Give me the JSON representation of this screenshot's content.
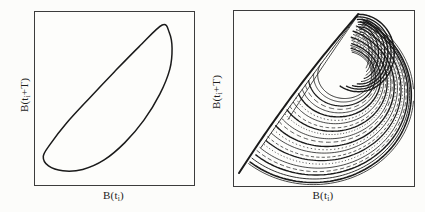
{
  "figure": {
    "background": "#fcfcfa",
    "ink": "#1a1a1a",
    "border_color": "#3c3c3c",
    "panels": [
      {
        "name": "limit-cycle-panel",
        "box": {
          "left": 34,
          "top": 11,
          "width": 159,
          "height": 173
        },
        "ylabel": {
          "prefix": "B(t",
          "sub": "i",
          "suffix": "+T)"
        },
        "xlabel": {
          "prefix": "B(t",
          "sub": "i",
          "suffix": ")"
        }
      },
      {
        "name": "chaotic-attractor-panel",
        "box": {
          "left": 233,
          "top": 10,
          "width": 180,
          "height": 175
        },
        "ylabel": {
          "prefix": "B(t",
          "sub": "i",
          "suffix": "+T)"
        },
        "xlabel": {
          "prefix": "B(t",
          "sub": "i",
          "suffix": ")"
        }
      }
    ]
  },
  "chart_data": [
    {
      "type": "line",
      "title": "Return map: periodic limit cycle",
      "xlabel": "B(t_i)",
      "ylabel": "B(t_i+T)",
      "axes": {
        "ticks": "none",
        "xrange": [
          0,
          1
        ],
        "yrange": [
          0,
          1
        ],
        "grid": false
      },
      "line_width_px": 1.5,
      "loop_points_normalized": [
        [
          0.8,
          0.925
        ],
        [
          0.655,
          0.8
        ],
        [
          0.5,
          0.655
        ],
        [
          0.345,
          0.505
        ],
        [
          0.2,
          0.36
        ],
        [
          0.095,
          0.235
        ],
        [
          0.052,
          0.165
        ],
        [
          0.085,
          0.11
        ],
        [
          0.175,
          0.082
        ],
        [
          0.3,
          0.09
        ],
        [
          0.435,
          0.145
        ],
        [
          0.565,
          0.245
        ],
        [
          0.685,
          0.375
        ],
        [
          0.785,
          0.525
        ],
        [
          0.848,
          0.67
        ],
        [
          0.862,
          0.79
        ],
        [
          0.845,
          0.88
        ]
      ]
    },
    {
      "type": "scatter",
      "title": "Return map: chaotic (strange) attractor",
      "xlabel": "B(t_i)",
      "ylabel": "B(t_i+T)",
      "axes": {
        "ticks": "none",
        "xrange": [
          0,
          1
        ],
        "yrange": [
          0,
          1
        ],
        "grid": false
      },
      "clip_edge": {
        "a": [
          0.024,
          0.066
        ],
        "b": [
          0.694,
          0.99
        ]
      },
      "edge_curves": [
        {
          "p0": [
            0.028,
            0.074
          ],
          "ctrl": [
            0.33,
            0.56
          ],
          "p1": [
            0.69,
            0.982
          ],
          "w": 2.0
        },
        {
          "p0": [
            0.15,
            0.22
          ],
          "ctrl": [
            0.42,
            0.62
          ],
          "p1": [
            0.688,
            0.975
          ],
          "w": 0.9
        },
        {
          "p0": [
            0.3,
            0.38
          ],
          "ctrl": [
            0.5,
            0.7
          ],
          "p1": [
            0.684,
            0.968
          ],
          "w": 0.8
        }
      ],
      "arcs": [
        {
          "c": [
            0.615,
            0.635
          ],
          "r": [
            0.15,
            0.135
          ],
          "a0": 150,
          "sw": 285,
          "w": 0.9
        },
        {
          "c": [
            0.608,
            0.63
          ],
          "r": [
            0.166,
            0.15
          ],
          "a0": 152,
          "sw": 283,
          "w": 0.8
        },
        {
          "c": [
            0.599,
            0.625
          ],
          "r": [
            0.186,
            0.168
          ],
          "a0": 154,
          "sw": 280,
          "w": 1.25
        },
        {
          "c": [
            0.592,
            0.62
          ],
          "r": [
            0.201,
            0.182
          ],
          "a0": 155,
          "sw": 278,
          "w": 0.7,
          "dash": "5.4 3.2"
        },
        {
          "c": [
            0.585,
            0.615
          ],
          "r": [
            0.217,
            0.197
          ],
          "a0": 157,
          "sw": 276,
          "w": 0.8
        },
        {
          "c": [
            0.577,
            0.61
          ],
          "r": [
            0.237,
            0.215
          ],
          "a0": 159,
          "sw": 273,
          "w": 1.45
        },
        {
          "c": [
            0.57,
            0.605
          ],
          "r": [
            0.253,
            0.23
          ],
          "a0": 160,
          "sw": 271,
          "w": 0.7,
          "dash": "1.4 2.2"
        },
        {
          "c": [
            0.563,
            0.601
          ],
          "r": [
            0.269,
            0.245
          ],
          "a0": 162,
          "sw": 269,
          "w": 0.8
        },
        {
          "c": [
            0.554,
            0.595
          ],
          "r": [
            0.288,
            0.263
          ],
          "a0": 164,
          "sw": 266,
          "w": 0.7,
          "dash": "3.6 2.5"
        },
        {
          "c": [
            0.547,
            0.59
          ],
          "r": [
            0.304,
            0.277
          ],
          "a0": 166,
          "sw": 264,
          "w": 1.35
        },
        {
          "c": [
            0.54,
            0.586
          ],
          "r": [
            0.32,
            0.292
          ],
          "a0": 167,
          "sw": 261,
          "w": 0.7,
          "dash": "1.1 1.8"
        },
        {
          "c": [
            0.531,
            0.58
          ],
          "r": [
            0.34,
            0.31
          ],
          "a0": 169,
          "sw": 259,
          "w": 0.8
        },
        {
          "c": [
            0.524,
            0.575
          ],
          "r": [
            0.355,
            0.325
          ],
          "a0": 171,
          "sw": 256,
          "w": 0.7,
          "dash": "4.7 2.9"
        },
        {
          "c": [
            0.515,
            0.569
          ],
          "r": [
            0.375,
            0.343
          ],
          "a0": 173,
          "sw": 254,
          "w": 1.45
        },
        {
          "c": [
            0.508,
            0.565
          ],
          "r": [
            0.391,
            0.358
          ],
          "a0": 174,
          "sw": 251,
          "w": 0.7,
          "dash": "1.4 2.5"
        },
        {
          "c": [
            0.501,
            0.56
          ],
          "r": [
            0.407,
            0.372
          ],
          "a0": 176,
          "sw": 249,
          "w": 0.8
        },
        {
          "c": [
            0.493,
            0.555
          ],
          "r": [
            0.427,
            0.391
          ],
          "a0": 178,
          "sw": 247,
          "w": 0.7,
          "dash": "3.2 2.2"
        },
        {
          "c": [
            0.486,
            0.55
          ],
          "r": [
            0.442,
            0.405
          ],
          "a0": 180,
          "sw": 244,
          "w": 1.25
        },
        {
          "c": [
            0.479,
            0.545
          ],
          "r": [
            0.458,
            0.42
          ],
          "a0": 181,
          "sw": 242,
          "w": 0.7,
          "dash": "1.1 2.2"
        },
        {
          "c": [
            0.47,
            0.54
          ],
          "r": [
            0.478,
            0.438
          ],
          "a0": 183,
          "sw": 239,
          "w": 0.8
        },
        {
          "c": [
            0.463,
            0.535
          ],
          "r": [
            0.494,
            0.453
          ],
          "a0": 185,
          "sw": 237,
          "w": 0.7,
          "dash": "4.3 2.5"
        },
        {
          "c": [
            0.456,
            0.53
          ],
          "r": [
            0.51,
            0.467
          ],
          "a0": 187,
          "sw": 234,
          "w": 1.45
        },
        {
          "c": [
            0.447,
            0.525
          ],
          "r": [
            0.529,
            0.485
          ],
          "a0": 189,
          "sw": 231,
          "w": 0.9
        },
        {
          "c": [
            0.44,
            0.52
          ],
          "r": [
            0.545,
            0.5
          ],
          "a0": 190,
          "sw": 230,
          "w": 1.6
        },
        {
          "c": [
            0.44,
            0.52
          ],
          "r": [
            0.558,
            0.512
          ],
          "a0": 190,
          "sw": 228,
          "w": 0.8
        }
      ],
      "cap_arcs": [
        {
          "c": [
            0.712,
            0.76
          ],
          "r": [
            0.038,
            0.105
          ],
          "a0": 96,
          "sw": -150,
          "w": 0.9
        },
        {
          "c": [
            0.7095,
            0.76
          ],
          "r": [
            0.058,
            0.119
          ],
          "a0": 96,
          "sw": -158,
          "w": 1.0
        },
        {
          "c": [
            0.707,
            0.76
          ],
          "r": [
            0.078,
            0.134
          ],
          "a0": 96,
          "sw": -166,
          "w": 0.9
        },
        {
          "c": [
            0.7045,
            0.76
          ],
          "r": [
            0.098,
            0.148
          ],
          "a0": 95,
          "sw": -174,
          "w": 1.2
        },
        {
          "c": [
            0.702,
            0.76
          ],
          "r": [
            0.118,
            0.163
          ],
          "a0": 95,
          "sw": -182,
          "w": 1.0
        },
        {
          "c": [
            0.6995,
            0.76
          ],
          "r": [
            0.138,
            0.177
          ],
          "a0": 94,
          "sw": -190,
          "w": 1.3
        },
        {
          "c": [
            0.697,
            0.76
          ],
          "r": [
            0.158,
            0.192
          ],
          "a0": 94,
          "sw": -198,
          "w": 1.4
        },
        {
          "c": [
            0.6945,
            0.76
          ],
          "r": [
            0.178,
            0.206
          ],
          "a0": 93,
          "sw": -206,
          "w": 1.3
        },
        {
          "c": [
            0.692,
            0.76
          ],
          "r": [
            0.198,
            0.221
          ],
          "a0": 93,
          "sw": -214,
          "w": 1.5
        }
      ]
    }
  ]
}
